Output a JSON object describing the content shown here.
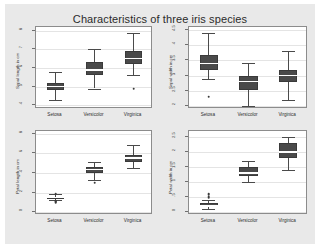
{
  "figure": {
    "title": "Characteristics of three iris species",
    "background_color": "#e9e9e9",
    "panel_color": "#ffffff",
    "box_color": "#4a4a4a",
    "grid_color": "#e4e4e4"
  },
  "chart_data": [
    {
      "type": "box",
      "panel": "top-left",
      "title": "Characteristics of three iris species",
      "xlabel": "",
      "ylabel": "Sepal length in cm",
      "categories": [
        "Setosa",
        "Versicolor",
        "Virginica"
      ],
      "ylim": [
        3.8,
        8.2
      ],
      "yticks": [
        4,
        5,
        6,
        7,
        8
      ],
      "ytick_labels": [
        "4",
        "5",
        "6",
        "7",
        "8"
      ],
      "grid": true,
      "boxes": [
        {
          "name": "Setosa",
          "min": 4.3,
          "q1": 4.8,
          "median": 5.0,
          "q3": 5.2,
          "max": 5.8,
          "outliers": []
        },
        {
          "name": "Versicolor",
          "min": 4.9,
          "q1": 5.6,
          "median": 5.9,
          "q3": 6.3,
          "max": 7.0,
          "outliers": []
        },
        {
          "name": "Virginica",
          "min": 5.6,
          "q1": 6.2,
          "median": 6.5,
          "q3": 6.9,
          "max": 7.9,
          "outliers": [
            4.9
          ]
        }
      ]
    },
    {
      "type": "box",
      "panel": "top-right",
      "xlabel": "",
      "ylabel": "Sepal width in cm",
      "categories": [
        "Setosa",
        "Versicolor",
        "Virginica"
      ],
      "ylim": [
        1.9,
        4.6
      ],
      "yticks": [
        2,
        2.5,
        3,
        3.5,
        4,
        4.5
      ],
      "ytick_labels": [
        "2",
        "2.5",
        "3",
        "3.5",
        "4",
        "4.5"
      ],
      "grid": true,
      "boxes": [
        {
          "name": "Setosa",
          "min": 2.9,
          "q1": 3.2,
          "median": 3.4,
          "q3": 3.675,
          "max": 4.4,
          "outliers": [
            2.3
          ]
        },
        {
          "name": "Versicolor",
          "min": 2.0,
          "q1": 2.525,
          "median": 2.8,
          "q3": 3.0,
          "max": 3.4,
          "outliers": []
        },
        {
          "name": "Virginica",
          "min": 2.2,
          "q1": 2.8,
          "median": 3.0,
          "q3": 3.175,
          "max": 3.8,
          "outliers": []
        }
      ]
    },
    {
      "type": "box",
      "panel": "bottom-left",
      "xlabel": "",
      "ylabel": "Petal length in cm",
      "categories": [
        "Setosa",
        "Versicolor",
        "Virginica"
      ],
      "ylim": [
        -0.3,
        8.3
      ],
      "yticks": [
        0,
        2,
        4,
        6,
        8
      ],
      "ytick_labels": [
        "0",
        "2",
        "4",
        "6",
        "8"
      ],
      "grid": true,
      "boxes": [
        {
          "name": "Setosa",
          "min": 1.2,
          "q1": 1.4,
          "median": 1.5,
          "q3": 1.575,
          "max": 1.9,
          "outliers": [
            1.0,
            1.1,
            1.9
          ]
        },
        {
          "name": "Versicolor",
          "min": 3.3,
          "q1": 4.0,
          "median": 4.35,
          "q3": 4.6,
          "max": 5.1,
          "outliers": [
            3.0
          ]
        },
        {
          "name": "Virginica",
          "min": 4.5,
          "q1": 5.1,
          "median": 5.55,
          "q3": 5.875,
          "max": 6.9,
          "outliers": []
        }
      ]
    },
    {
      "type": "box",
      "panel": "bottom-right",
      "xlabel": "",
      "ylabel": "Petal width in cm",
      "categories": [
        "Setosa",
        "Versicolor",
        "Virginica"
      ],
      "ylim": [
        -0.1,
        2.7
      ],
      "yticks": [
        0,
        0.5,
        1,
        1.5,
        2,
        2.5
      ],
      "ytick_labels": [
        "0",
        ".5",
        "1",
        "1.5",
        "2",
        "2.5"
      ],
      "grid": true,
      "boxes": [
        {
          "name": "Setosa",
          "min": 0.1,
          "q1": 0.2,
          "median": 0.2,
          "q3": 0.3,
          "max": 0.4,
          "outliers": [
            0.5,
            0.6
          ]
        },
        {
          "name": "Versicolor",
          "min": 1.0,
          "q1": 1.2,
          "median": 1.3,
          "q3": 1.5,
          "max": 1.7,
          "outliers": []
        },
        {
          "name": "Virginica",
          "min": 1.4,
          "q1": 1.8,
          "median": 2.0,
          "q3": 2.3,
          "max": 2.5,
          "outliers": []
        }
      ]
    }
  ]
}
